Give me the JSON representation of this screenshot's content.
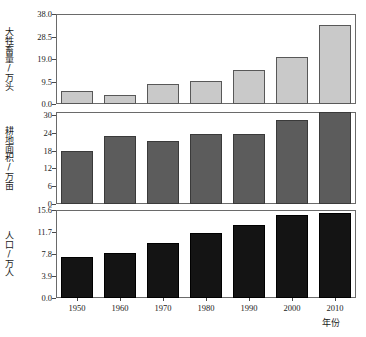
{
  "chart_data": {
    "type": "bar",
    "title": "",
    "xlabel": "年份",
    "categories": [
      "1950",
      "1960",
      "1970",
      "1980",
      "1990",
      "2000",
      "2010"
    ],
    "grid": false,
    "legend_position": "none",
    "panels": [
      {
        "id": "livestock",
        "ylabel": "大牲畜量/万头",
        "ylim": [
          0.0,
          38.0
        ],
        "yticks": [
          "0.0",
          "9.5",
          "19.0",
          "28.5",
          "38.0"
        ],
        "ytick_values": [
          0.0,
          9.5,
          19.0,
          28.5,
          38.0
        ],
        "color": "#c9c9c9",
        "edge_color": "#585858",
        "values": [
          5.5,
          3.8,
          8.3,
          9.9,
          14.5,
          19.8,
          33.2
        ]
      },
      {
        "id": "farmland",
        "ylabel": "耕地面积/万亩",
        "ylim": [
          0,
          31
        ],
        "yticks": [
          "0",
          "6",
          "12",
          "18",
          "24",
          "30"
        ],
        "ytick_values": [
          0,
          6,
          12,
          18,
          24,
          30
        ],
        "color": "#5c5c5c",
        "edge_color": "#3a3a3a",
        "values": [
          18.0,
          22.8,
          21.2,
          23.5,
          23.5,
          28.3,
          31.0
        ]
      },
      {
        "id": "population",
        "ylabel": "人口/万人",
        "ylim": [
          0.0,
          15.6
        ],
        "yticks": [
          "0.0",
          "3.9",
          "7.8",
          "11.7",
          "15.6"
        ],
        "ytick_values": [
          0.0,
          3.9,
          7.8,
          11.7,
          15.6
        ],
        "color": "#141414",
        "edge_color": "#000000",
        "values": [
          7.3,
          8.0,
          9.7,
          11.5,
          13.0,
          14.8,
          15.0
        ]
      }
    ]
  }
}
